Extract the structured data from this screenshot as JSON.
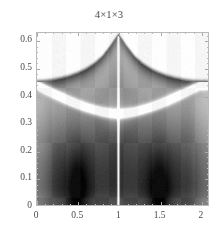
{
  "figure": {
    "title": "4×1×3",
    "background_color": "#ffffff",
    "frame_color": "#b9b9b9",
    "text_color": "#4a4a4a"
  },
  "axes": {
    "x": {
      "min": 0,
      "max": 2.1,
      "ticks": [
        0,
        0.5,
        1,
        1.5,
        2
      ],
      "tick_labels": [
        "0",
        "0.5",
        "1",
        "1.5",
        "2"
      ],
      "minor_ticks": [
        0.1,
        0.2,
        0.3,
        0.4,
        0.6,
        0.7,
        0.8,
        0.9,
        1.1,
        1.2,
        1.3,
        1.4,
        1.6,
        1.7,
        1.8,
        1.9,
        2.0
      ]
    },
    "y": {
      "min": 0,
      "max": 0.63,
      "ticks": [
        0,
        0.1,
        0.2,
        0.3,
        0.4,
        0.5,
        0.6
      ],
      "tick_labels": [
        "0",
        "0.1",
        "0.2",
        "0.3",
        "0.4",
        "0.5",
        "0.6"
      ],
      "minor_ticks": [
        0.02,
        0.04,
        0.06,
        0.08,
        0.12,
        0.14,
        0.16,
        0.18,
        0.22,
        0.24,
        0.26,
        0.28,
        0.32,
        0.34,
        0.36,
        0.38,
        0.42,
        0.44,
        0.46,
        0.48,
        0.52,
        0.54,
        0.56,
        0.58,
        0.62
      ]
    }
  },
  "chart_data": {
    "type": "heatmap",
    "title": "4×1×3",
    "xlabel": "",
    "ylabel": "",
    "xlim": [
      0,
      2.1
    ],
    "ylim": [
      0,
      0.63
    ],
    "grid": false,
    "legend": "none",
    "colormap": "grayscale-inverted",
    "colormap_low": "#ffffff",
    "colormap_high": "#101010",
    "x_tick_values": [
      0,
      0.5,
      1,
      1.5,
      2
    ],
    "y_tick_values": [
      0,
      0.1,
      0.2,
      0.3,
      0.4,
      0.5,
      0.6
    ],
    "features": {
      "symmetry_axis_x": 1,
      "cusp_peak": [
        1,
        0.62
      ],
      "edge_shoulder_y": 0.45,
      "white_arc_endpoints": [
        [
          0,
          0.44
        ],
        [
          2.1,
          0.44
        ]
      ],
      "white_arc_minimum": [
        1,
        0.33
      ],
      "dark_streak_x": [
        0.5,
        1.5
      ]
    },
    "upper_boundary": {
      "x": [
        0.0,
        0.1,
        0.2,
        0.3,
        0.4,
        0.5,
        0.6,
        0.7,
        0.8,
        0.9,
        0.95,
        1.0,
        1.05,
        1.1,
        1.2,
        1.3,
        1.4,
        1.5,
        1.6,
        1.7,
        1.8,
        1.9,
        2.0,
        2.1
      ],
      "y": [
        0.45,
        0.452,
        0.456,
        0.462,
        0.47,
        0.481,
        0.495,
        0.514,
        0.54,
        0.578,
        0.6,
        0.62,
        0.6,
        0.578,
        0.54,
        0.514,
        0.495,
        0.481,
        0.47,
        0.462,
        0.456,
        0.452,
        0.45,
        0.45
      ]
    },
    "white_arc": {
      "x": [
        0.0,
        0.1,
        0.2,
        0.3,
        0.4,
        0.5,
        0.6,
        0.7,
        0.8,
        0.9,
        1.0,
        1.1,
        1.2,
        1.3,
        1.4,
        1.5,
        1.6,
        1.7,
        1.8,
        1.9,
        2.0,
        2.1
      ],
      "y": [
        0.44,
        0.424,
        0.409,
        0.395,
        0.381,
        0.369,
        0.358,
        0.349,
        0.341,
        0.336,
        0.333,
        0.336,
        0.341,
        0.349,
        0.358,
        0.369,
        0.381,
        0.395,
        0.409,
        0.424,
        0.438,
        0.44
      ]
    }
  }
}
